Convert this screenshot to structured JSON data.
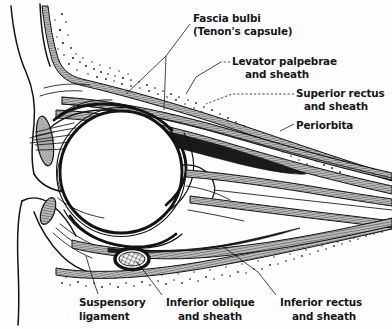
{
  "figure": {
    "background_color": "#fefefe",
    "ink_color": "#131313",
    "label_color": "#15161a"
  },
  "labels": [
    {
      "id": "fascia-bulbi",
      "name": "fascia-bulbi-label",
      "line1": "Fascia bulbi",
      "line2": "(Tenon's capsule)",
      "x": 193,
      "y": 18,
      "leader_style": "solid"
    },
    {
      "id": "levator-palpebrae",
      "name": "levator-palpebrae-label",
      "line1": "Levator palpebrae",
      "line2": "and sheath",
      "x": 232,
      "y": 61,
      "leader_style": "dashed"
    },
    {
      "id": "superior-rectus",
      "name": "superior-rectus-label",
      "line1": "Superior rectus",
      "line2": "and sheath",
      "x": 296,
      "y": 93,
      "leader_style": "dashed"
    },
    {
      "id": "periorbita",
      "name": "periorbita-label",
      "line1": "Periorbita",
      "line2": "",
      "x": 296,
      "y": 125,
      "leader_style": "solid"
    },
    {
      "id": "suspensory-ligament",
      "name": "suspensory-ligament-label",
      "line1": "Suspensory",
      "line2": "ligament",
      "x": 79,
      "y": 302,
      "leader_style": "solid"
    },
    {
      "id": "inferior-oblique",
      "name": "inferior-oblique-label",
      "line1": "Inferior oblique",
      "line2": "and sheath",
      "x": 164,
      "y": 302,
      "leader_style": "solid"
    },
    {
      "id": "inferior-rectus",
      "name": "inferior-rectus-label",
      "line1": "Inferior rectus",
      "line2": "and sheath",
      "x": 278,
      "y": 302,
      "leader_style": "solid"
    }
  ],
  "structures": [
    {
      "id": "globe",
      "name": "eyeball-globe",
      "cx": 121,
      "cy": 172,
      "r": 61
    },
    {
      "id": "upper-tarsal-plate",
      "name": "upper-tarsal-plate",
      "cx": 46,
      "cy": 140
    },
    {
      "id": "lower-tarsal-plate",
      "name": "lower-tarsal-plate",
      "cx": 47,
      "cy": 210
    },
    {
      "id": "inferior-oblique-muscle",
      "name": "inferior-oblique-muscle",
      "cx": 131,
      "cy": 258
    },
    {
      "id": "superior-rectus-muscle",
      "name": "superior-rectus-muscle"
    },
    {
      "id": "inferior-rectus-muscle",
      "name": "inferior-rectus-muscle"
    },
    {
      "id": "levator-palpebrae-muscle",
      "name": "levator-palpebrae-muscle"
    },
    {
      "id": "periorbita-upper",
      "name": "periorbita-upper-lining"
    },
    {
      "id": "periorbita-lower",
      "name": "periorbita-lower-lining"
    },
    {
      "id": "orbital-fat-upper",
      "name": "orbital-fat-upper"
    },
    {
      "id": "orbital-fat-lower",
      "name": "orbital-fat-lower"
    }
  ]
}
